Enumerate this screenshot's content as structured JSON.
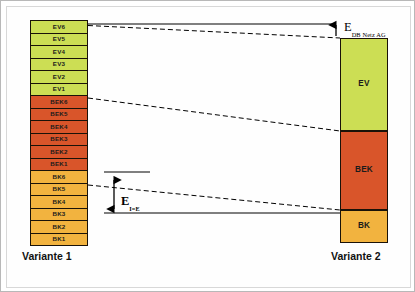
{
  "diagram": {
    "title_hidden": "",
    "colors": {
      "ev": "#ccde54",
      "bek": "#d9552a",
      "bk": "#f2b33f",
      "stroke": "#1a1208",
      "line": "#000000",
      "frame": "#b8b8b8"
    },
    "variant1": {
      "caption": "Variante 1",
      "blocks": [
        {
          "label": "EV6",
          "group": "ev"
        },
        {
          "label": "EV5",
          "group": "ev"
        },
        {
          "label": "EV4",
          "group": "ev"
        },
        {
          "label": "EV3",
          "group": "ev"
        },
        {
          "label": "EV2",
          "group": "ev"
        },
        {
          "label": "EV1",
          "group": "ev"
        },
        {
          "label": "BEK6",
          "group": "bek"
        },
        {
          "label": "BEK5",
          "group": "bek"
        },
        {
          "label": "BEK4",
          "group": "bek"
        },
        {
          "label": "BEK3",
          "group": "bek"
        },
        {
          "label": "BEK2",
          "group": "bek"
        },
        {
          "label": "BEK1",
          "group": "bek"
        },
        {
          "label": "BK6",
          "group": "bk"
        },
        {
          "label": "BK5",
          "group": "bk"
        },
        {
          "label": "BK4",
          "group": "bk"
        },
        {
          "label": "BK3",
          "group": "bk"
        },
        {
          "label": "BK2",
          "group": "bk"
        },
        {
          "label": "BK1",
          "group": "bk"
        }
      ]
    },
    "variant2": {
      "caption": "Variante 2",
      "blocks": [
        {
          "label": "EV",
          "group": "ev"
        },
        {
          "label": "BEK",
          "group": "bek"
        },
        {
          "label": "BK",
          "group": "bk"
        }
      ]
    },
    "annotations": {
      "top": {
        "symbol": "E",
        "subscript": "DB Netz AG"
      },
      "mid": {
        "symbol": "E",
        "subscript": "I=E"
      }
    }
  }
}
